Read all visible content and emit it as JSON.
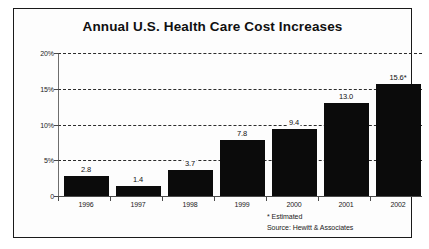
{
  "chart_data": {
    "type": "bar",
    "title": "Annual U.S. Health Care Cost Increases",
    "xlabel": "",
    "ylabel": "",
    "categories": [
      "1996",
      "1997",
      "1998",
      "1999",
      "2000",
      "2001",
      "2002"
    ],
    "values": [
      2.8,
      1.4,
      3.7,
      7.8,
      9.4,
      13.0,
      15.6
    ],
    "value_labels": [
      "2.8",
      "1.4",
      "3.7",
      "7.8",
      "9.4",
      "13.0",
      "15.6*"
    ],
    "ylim": [
      0,
      20
    ],
    "y_ticks": [
      0,
      5,
      10,
      15,
      20
    ],
    "y_tick_labels": [
      "0",
      "5%",
      "10%",
      "15%",
      "20%"
    ],
    "grid": true,
    "grid_style": "dashed-horizontal",
    "legend": "none",
    "bar_color": "#0b0b0b",
    "background_color": "#fdfdfd",
    "frame_color": "#1a1a1a",
    "annotations": [
      "* Estimated",
      "Source: Hewitt & Associates"
    ]
  },
  "footnotes": {
    "estimated": "* Estimated",
    "source": "Source: Hewitt & Associates"
  }
}
